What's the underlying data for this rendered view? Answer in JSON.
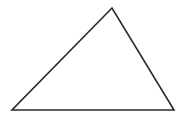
{
  "diagram": {
    "shape": "triangle",
    "stroke_color": "#2a2a2a",
    "fill_color": "#ffffff",
    "background_color": "#ffffff",
    "stroke_width": 1.6,
    "vertices": [
      {
        "name": "apex",
        "x": 112,
        "y": 8
      },
      {
        "name": "bottom-left",
        "x": 12,
        "y": 110
      },
      {
        "name": "bottom-right",
        "x": 174,
        "y": 110
      }
    ]
  }
}
